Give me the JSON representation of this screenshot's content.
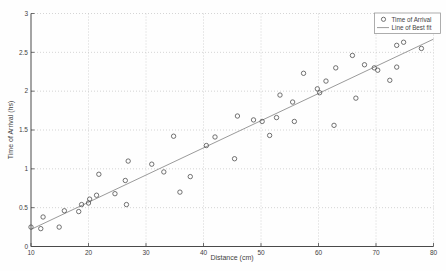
{
  "chart_data": {
    "type": "scatter",
    "title": "",
    "xlabel": "Distance (cm)",
    "ylabel": "Time of Arrival (hs)",
    "xlim": [
      10,
      80
    ],
    "ylim": [
      0,
      3
    ],
    "xticks": [
      10,
      20,
      30,
      40,
      50,
      60,
      70,
      80
    ],
    "ytick_labels": [
      "0",
      "0.5",
      "1",
      "1.5",
      "2",
      "2.5",
      "3"
    ],
    "yticks": [
      0,
      0.5,
      1,
      1.5,
      2,
      2.5,
      3
    ],
    "grid": true,
    "legend_position": "top-right",
    "series": [
      {
        "name": "Time of Arrival",
        "kind": "scatter",
        "marker": "open-circle",
        "points": [
          [
            10.0,
            0.25
          ],
          [
            11.7,
            0.23
          ],
          [
            12.1,
            0.38
          ],
          [
            14.9,
            0.25
          ],
          [
            15.8,
            0.46
          ],
          [
            18.3,
            0.45
          ],
          [
            18.8,
            0.54
          ],
          [
            20.0,
            0.56
          ],
          [
            20.2,
            0.61
          ],
          [
            21.4,
            0.66
          ],
          [
            21.8,
            0.93
          ],
          [
            24.6,
            0.68
          ],
          [
            26.4,
            0.85
          ],
          [
            26.6,
            0.54
          ],
          [
            26.9,
            1.1
          ],
          [
            31.0,
            1.06
          ],
          [
            33.1,
            0.96
          ],
          [
            34.8,
            1.42
          ],
          [
            35.9,
            0.7
          ],
          [
            37.7,
            0.9
          ],
          [
            40.5,
            1.3
          ],
          [
            42.0,
            1.41
          ],
          [
            45.4,
            1.13
          ],
          [
            45.9,
            1.68
          ],
          [
            48.7,
            1.63
          ],
          [
            50.2,
            1.61
          ],
          [
            51.5,
            1.43
          ],
          [
            52.7,
            1.66
          ],
          [
            53.3,
            1.95
          ],
          [
            55.5,
            1.86
          ],
          [
            55.8,
            1.61
          ],
          [
            57.4,
            2.23
          ],
          [
            59.8,
            2.03
          ],
          [
            60.2,
            1.98
          ],
          [
            61.3,
            2.13
          ],
          [
            62.7,
            1.56
          ],
          [
            63.0,
            2.3
          ],
          [
            65.9,
            2.46
          ],
          [
            66.5,
            1.91
          ],
          [
            68.0,
            2.34
          ],
          [
            69.7,
            2.3
          ],
          [
            70.3,
            2.27
          ],
          [
            72.4,
            2.14
          ],
          [
            73.6,
            2.31
          ],
          [
            73.6,
            2.59
          ],
          [
            74.8,
            2.63
          ],
          [
            77.9,
            2.55
          ]
        ]
      },
      {
        "name": "Line of Best fit",
        "kind": "line",
        "endpoints": [
          [
            10,
            0.22
          ],
          [
            80,
            2.67
          ]
        ]
      }
    ],
    "colors": {
      "marker": "#4f4f4f",
      "fit_line": "#8f8f8f",
      "grid": "#c3c3c3",
      "axis": "#4a4a4a",
      "text": "#3f3f3f",
      "legend_border": "#9a9a9a",
      "legend_bg": "#ffffff"
    }
  }
}
